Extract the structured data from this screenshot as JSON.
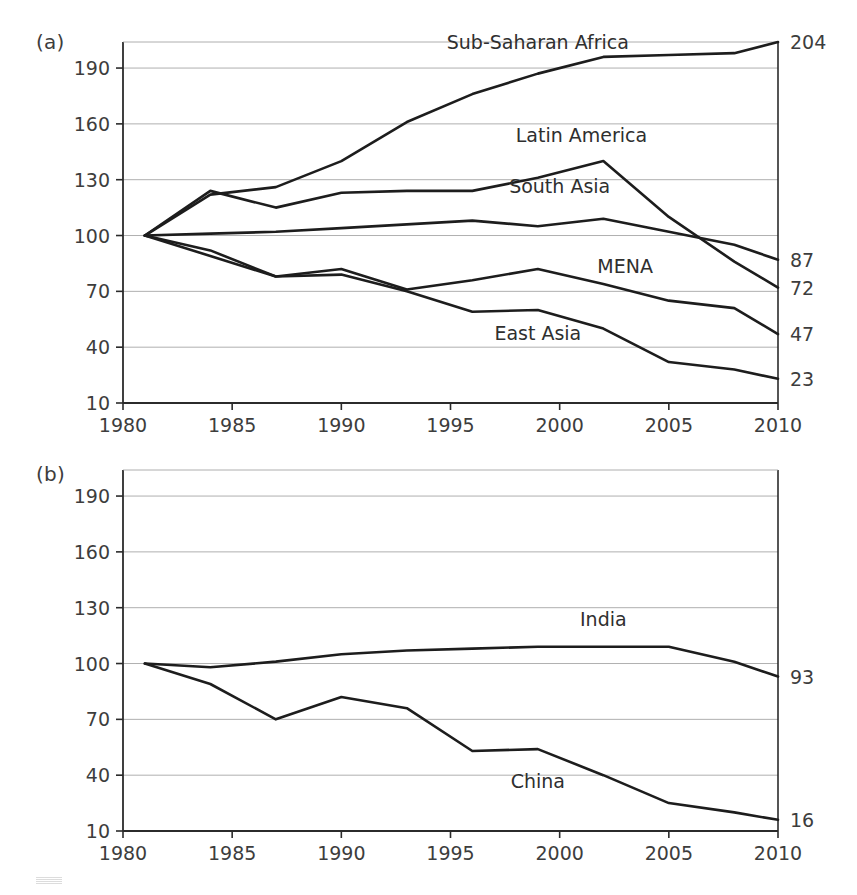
{
  "figure": {
    "panels": [
      {
        "tag": "(a)"
      },
      {
        "tag": "(b)"
      }
    ]
  },
  "chart_data": [
    {
      "type": "line",
      "panel": "(a)",
      "title": "",
      "xlabel": "",
      "ylabel": "",
      "xlim": [
        1980,
        2010
      ],
      "ylim": [
        10,
        204
      ],
      "grid": "horizontal",
      "legend_position": "inline-annotations",
      "xticks": [
        1980,
        1985,
        1990,
        1995,
        2000,
        2005,
        2010
      ],
      "yticks": [
        10,
        40,
        70,
        100,
        130,
        160,
        190
      ],
      "x": [
        1981,
        1984,
        1987,
        1990,
        1993,
        1996,
        1999,
        2002,
        2005,
        2008,
        2010
      ],
      "series": [
        {
          "name": "Sub-Saharan Africa",
          "end_label": "204",
          "label_x": 1999,
          "label_y": 200,
          "values": [
            100,
            122,
            126,
            140,
            161,
            176,
            187,
            196,
            197,
            198,
            204
          ]
        },
        {
          "name": "Latin America",
          "end_label": "72",
          "label_x": 2001,
          "label_y": 150,
          "values": [
            100,
            124,
            115,
            123,
            124,
            124,
            131,
            140,
            110,
            86,
            72
          ]
        },
        {
          "name": "South Asia",
          "end_label": "87",
          "label_x": 2000,
          "label_y": 123,
          "values": [
            100,
            101,
            102,
            104,
            106,
            108,
            105,
            109,
            102,
            95,
            87
          ]
        },
        {
          "name": "MENA",
          "end_label": "47",
          "label_x": 2003,
          "label_y": 80,
          "values": [
            100,
            92,
            78,
            82,
            71,
            76,
            82,
            74,
            65,
            61,
            47
          ]
        },
        {
          "name": "East Asia",
          "end_label": "23",
          "label_x": 1999,
          "label_y": 44,
          "values": [
            100,
            89,
            78,
            79,
            70,
            59,
            60,
            50,
            32,
            28,
            23
          ]
        }
      ]
    },
    {
      "type": "line",
      "panel": "(b)",
      "title": "",
      "xlabel": "",
      "ylabel": "",
      "xlim": [
        1980,
        2010
      ],
      "ylim": [
        10,
        204
      ],
      "grid": "horizontal",
      "legend_position": "inline-annotations",
      "xticks": [
        1980,
        1985,
        1990,
        1995,
        2000,
        2005,
        2010
      ],
      "yticks": [
        10,
        40,
        70,
        100,
        130,
        160,
        190
      ],
      "x": [
        1981,
        1984,
        1987,
        1990,
        1993,
        1996,
        1999,
        2002,
        2005,
        2008,
        2010
      ],
      "series": [
        {
          "name": "India",
          "end_label": "93",
          "label_x": 2002,
          "label_y": 120,
          "values": [
            100,
            98,
            101,
            105,
            107,
            108,
            109,
            109,
            109,
            101,
            93
          ]
        },
        {
          "name": "China",
          "end_label": "16",
          "label_x": 1999,
          "label_y": 33,
          "values": [
            100,
            89,
            70,
            82,
            76,
            53,
            54,
            40,
            25,
            20,
            16
          ]
        }
      ]
    }
  ]
}
